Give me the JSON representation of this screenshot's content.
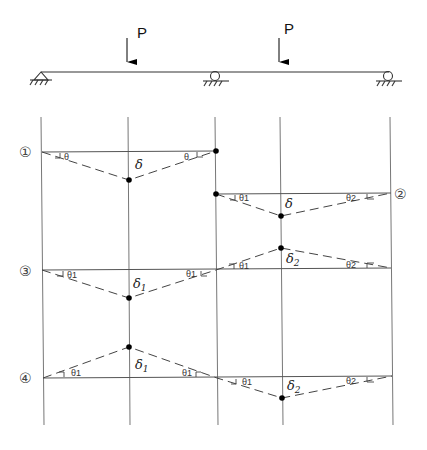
{
  "diagram": {
    "beam": {
      "supports": [
        {
          "type": "pin",
          "label": ""
        },
        {
          "type": "roller",
          "label": ""
        },
        {
          "type": "roller",
          "label": ""
        }
      ],
      "loads": [
        {
          "label": "P",
          "direction": "down"
        },
        {
          "label": "P",
          "direction": "down"
        }
      ]
    },
    "cases": [
      {
        "id": "case-1",
        "number": "①",
        "deflection_label": "δ",
        "deflection_sub": "",
        "angle_left": "θ",
        "angle_right": "θ",
        "span": "left",
        "direction": "down"
      },
      {
        "id": "case-2",
        "number": "②",
        "deflection_label": "δ",
        "deflection_sub": "",
        "angle_left": "θ1",
        "angle_right": "θ2",
        "span": "right",
        "direction": "down"
      },
      {
        "id": "case-3",
        "number": "③",
        "left": {
          "deflection_label": "δ",
          "deflection_sub": "1",
          "angle_left": "θ1",
          "angle_right": "θ1",
          "direction": "down"
        },
        "right": {
          "deflection_label": "δ",
          "deflection_sub": "2",
          "angle_left": "θ1",
          "angle_right": "θ2",
          "direction": "up"
        }
      },
      {
        "id": "case-4",
        "number": "④",
        "left": {
          "deflection_label": "δ",
          "deflection_sub": "1",
          "angle_left": "θ1",
          "angle_right": "θ1",
          "direction": "up"
        },
        "right": {
          "deflection_label": "δ",
          "deflection_sub": "2",
          "angle_left": "θ1",
          "angle_right": "θ2",
          "direction": "down"
        }
      }
    ]
  }
}
